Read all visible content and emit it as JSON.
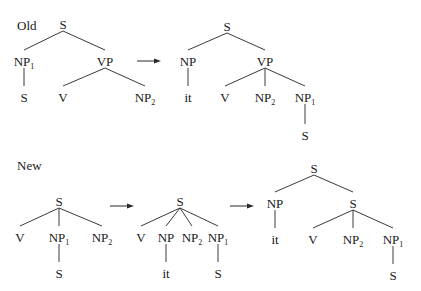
{
  "sections": [
    {
      "label": "Old",
      "trees": [
        {
          "name": "old-source-tree",
          "nodes": [
            {
              "id": "s",
              "label": "S",
              "sub": ""
            },
            {
              "id": "np1",
              "label": "NP",
              "sub": "1"
            },
            {
              "id": "vp",
              "label": "VP",
              "sub": ""
            },
            {
              "id": "s2",
              "label": "S",
              "sub": ""
            },
            {
              "id": "v",
              "label": "V",
              "sub": ""
            },
            {
              "id": "np2",
              "label": "NP",
              "sub": "2"
            }
          ],
          "edges": [
            [
              "s",
              "np1"
            ],
            [
              "s",
              "vp"
            ],
            [
              "np1",
              "s2"
            ],
            [
              "vp",
              "v"
            ],
            [
              "vp",
              "np2"
            ]
          ]
        },
        {
          "name": "old-result-tree",
          "nodes": [
            {
              "id": "s",
              "label": "S",
              "sub": ""
            },
            {
              "id": "np",
              "label": "NP",
              "sub": ""
            },
            {
              "id": "vp",
              "label": "VP",
              "sub": ""
            },
            {
              "id": "it",
              "label": "it",
              "sub": ""
            },
            {
              "id": "v",
              "label": "V",
              "sub": ""
            },
            {
              "id": "np2",
              "label": "NP",
              "sub": "2"
            },
            {
              "id": "np1",
              "label": "NP",
              "sub": "1"
            },
            {
              "id": "s2",
              "label": "S",
              "sub": ""
            }
          ],
          "edges": [
            [
              "s",
              "np"
            ],
            [
              "s",
              "vp"
            ],
            [
              "np",
              "it"
            ],
            [
              "vp",
              "v"
            ],
            [
              "vp",
              "np2"
            ],
            [
              "vp",
              "np1"
            ],
            [
              "np1",
              "s2"
            ]
          ]
        }
      ]
    },
    {
      "label": "New",
      "trees": [
        {
          "name": "new-source-tree",
          "nodes": [
            {
              "id": "s",
              "label": "S",
              "sub": ""
            },
            {
              "id": "v",
              "label": "V",
              "sub": ""
            },
            {
              "id": "np1",
              "label": "NP",
              "sub": "1"
            },
            {
              "id": "np2",
              "label": "NP",
              "sub": "2"
            },
            {
              "id": "s2",
              "label": "S",
              "sub": ""
            }
          ],
          "edges": [
            [
              "s",
              "v"
            ],
            [
              "s",
              "np1"
            ],
            [
              "s",
              "np2"
            ],
            [
              "np1",
              "s2"
            ]
          ]
        },
        {
          "name": "new-intermediate-tree",
          "nodes": [
            {
              "id": "s",
              "label": "S",
              "sub": ""
            },
            {
              "id": "v",
              "label": "V",
              "sub": ""
            },
            {
              "id": "np",
              "label": "NP",
              "sub": ""
            },
            {
              "id": "np2",
              "label": "NP",
              "sub": "2"
            },
            {
              "id": "np1",
              "label": "NP",
              "sub": "1"
            },
            {
              "id": "it",
              "label": "it",
              "sub": ""
            },
            {
              "id": "s2",
              "label": "S",
              "sub": ""
            }
          ],
          "edges": [
            [
              "s",
              "v"
            ],
            [
              "s",
              "np"
            ],
            [
              "s",
              "np2"
            ],
            [
              "s",
              "np1"
            ],
            [
              "np",
              "it"
            ],
            [
              "np1",
              "s2"
            ]
          ]
        },
        {
          "name": "new-result-tree",
          "nodes": [
            {
              "id": "s",
              "label": "S",
              "sub": ""
            },
            {
              "id": "np",
              "label": "NP",
              "sub": ""
            },
            {
              "id": "sb",
              "label": "S",
              "sub": ""
            },
            {
              "id": "it",
              "label": "it",
              "sub": ""
            },
            {
              "id": "v",
              "label": "V",
              "sub": ""
            },
            {
              "id": "np2",
              "label": "NP",
              "sub": "2"
            },
            {
              "id": "np1",
              "label": "NP",
              "sub": "1"
            },
            {
              "id": "s2",
              "label": "S",
              "sub": ""
            }
          ],
          "edges": [
            [
              "s",
              "np"
            ],
            [
              "s",
              "sb"
            ],
            [
              "np",
              "it"
            ],
            [
              "sb",
              "v"
            ],
            [
              "sb",
              "np2"
            ],
            [
              "sb",
              "np1"
            ],
            [
              "np1",
              "s2"
            ]
          ]
        }
      ]
    }
  ],
  "arrow_symbol": "right-arrow"
}
